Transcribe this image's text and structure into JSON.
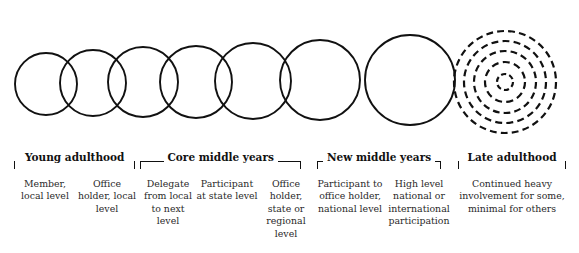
{
  "diagram": {
    "stroke_color": "#111111",
    "background": "#ffffff"
  },
  "circles": [
    {
      "name": "circle-member-local",
      "cx": 46,
      "cy": 84,
      "r": 31,
      "style": "solid"
    },
    {
      "name": "circle-office-holder-local",
      "cx": 93,
      "cy": 83,
      "r": 33,
      "style": "solid"
    },
    {
      "name": "circle-delegate-local-to-next",
      "cx": 143,
      "cy": 82,
      "r": 35,
      "style": "solid"
    },
    {
      "name": "circle-participant-state",
      "cx": 196,
      "cy": 82,
      "r": 36,
      "style": "solid"
    },
    {
      "name": "circle-office-holder-state",
      "cx": 253,
      "cy": 81,
      "r": 38,
      "style": "solid"
    },
    {
      "name": "circle-participant-national",
      "cx": 320,
      "cy": 80,
      "r": 40,
      "style": "solid"
    },
    {
      "name": "circle-high-level-national",
      "cx": 410,
      "cy": 80,
      "r": 45,
      "style": "solid"
    },
    {
      "name": "circle-late-adulthood-ring-1",
      "cx": 505,
      "cy": 82,
      "r": 51,
      "style": "dashed"
    },
    {
      "name": "circle-late-adulthood-ring-2",
      "cx": 505,
      "cy": 82,
      "r": 41,
      "style": "dashed"
    },
    {
      "name": "circle-late-adulthood-ring-3",
      "cx": 505,
      "cy": 82,
      "r": 31,
      "style": "dashed"
    },
    {
      "name": "circle-late-adulthood-ring-4",
      "cx": 505,
      "cy": 82,
      "r": 20,
      "style": "dashed"
    },
    {
      "name": "circle-late-adulthood-ring-5",
      "cx": 505,
      "cy": 82,
      "r": 8,
      "style": "dashed"
    }
  ],
  "brackets": [
    {
      "name": "bracket-young-adulthood",
      "label": "Young adulthood",
      "left": 14,
      "right": 135,
      "rule": false
    },
    {
      "name": "bracket-core-middle-years",
      "label": "Core middle years",
      "left": 140,
      "right": 301,
      "rule": true
    },
    {
      "name": "bracket-new-middle-years",
      "label": "New middle years",
      "left": 317,
      "right": 441,
      "rule": true
    },
    {
      "name": "bracket-late-adulthood",
      "label": "Late adulthood",
      "left": 458,
      "right": 566,
      "rule": false
    }
  ],
  "columns": [
    {
      "name": "column-member-local",
      "left": 14,
      "width": 62,
      "text": "Member, local level"
    },
    {
      "name": "column-office-holder-local",
      "left": 76,
      "width": 62,
      "text": "Office holder, local level"
    },
    {
      "name": "column-delegate-local-to-next",
      "left": 140,
      "width": 56,
      "text": "Delegate from local to next level"
    },
    {
      "name": "column-participant-at-state",
      "left": 196,
      "width": 62,
      "text": "Participant at state level"
    },
    {
      "name": "column-office-holder-state",
      "left": 258,
      "width": 56,
      "text": "Office holder, state or regional level"
    },
    {
      "name": "column-participant-national",
      "left": 317,
      "width": 66,
      "text": "Participant to office holder, national level"
    },
    {
      "name": "column-high-level-national",
      "left": 383,
      "width": 72,
      "text": "High level national or international participation"
    },
    {
      "name": "column-continued-involvement",
      "left": 458,
      "width": 108,
      "text": "Continued heavy involvement for some, minimal for others"
    }
  ]
}
